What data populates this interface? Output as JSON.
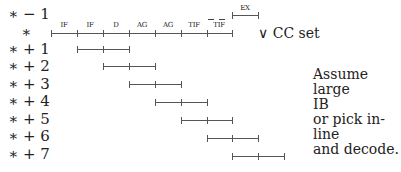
{
  "rows": [
    {
      "label": "∗ − 1"
    },
    {
      "label": "∗"
    },
    {
      "label": "∗ + 1"
    },
    {
      "label": "∗ + 2"
    },
    {
      "label": "∗ + 3"
    },
    {
      "label": "∗ + 4"
    },
    {
      "label": "∗ + 5"
    },
    {
      "label": "∗ + 6"
    },
    {
      "label": "∗ + 7"
    }
  ],
  "stages": [
    "IF",
    "IF",
    "D",
    "AG",
    "AG",
    "TIF",
    "TIF"
  ],
  "prev_stage": "EX",
  "cc_annotation": "∨ CC set",
  "note_lines": [
    "Assume large",
    "IB",
    "or pick in-line",
    "and decode."
  ]
}
